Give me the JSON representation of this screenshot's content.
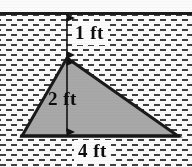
{
  "figure": {
    "background_color": "#fbfbfb",
    "ground_line_color": "#1b1b1b",
    "hatch_color": "#3f3f3f",
    "shape": {
      "name": "triangle",
      "fill_color": "#a8a8a8",
      "stroke_color": "#1a1a1a",
      "vertices": [
        {
          "label": "apex",
          "x": 67,
          "y": 58
        },
        {
          "label": "base-left",
          "x": 22,
          "y": 136
        },
        {
          "label": "base-right",
          "x": 178,
          "y": 136
        }
      ]
    },
    "dimensions": [
      {
        "id": "depth-to-apex",
        "value": "1 ft",
        "orientation": "vertical",
        "arrow": "double-headed",
        "from": {
          "x": 67,
          "y": 15
        },
        "to": {
          "x": 67,
          "y": 58
        }
      },
      {
        "id": "triangle-height",
        "value": "2 ft",
        "orientation": "vertical",
        "arrow": "double-headed",
        "from": {
          "x": 67,
          "y": 58
        },
        "to": {
          "x": 67,
          "y": 136
        }
      },
      {
        "id": "triangle-base",
        "value": "4 ft",
        "orientation": "horizontal",
        "arrow": "none",
        "from": {
          "x": 22,
          "y": 136
        },
        "to": {
          "x": 178,
          "y": 136
        }
      }
    ]
  },
  "chart_data": {
    "type": "diagram",
    "xlabel": "",
    "ylabel": "",
    "annotations": [
      "1 ft",
      "2 ft",
      "4 ft"
    ],
    "series": [
      {
        "name": "triangle",
        "values": [
          {
            "x": 67,
            "y": 58
          },
          {
            "x": 22,
            "y": 136
          },
          {
            "x": 178,
            "y": 136
          }
        ]
      }
    ],
    "measurements": {
      "depth_to_apex_ft": 1,
      "height_ft": 2,
      "base_ft": 4
    }
  }
}
